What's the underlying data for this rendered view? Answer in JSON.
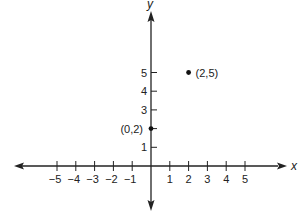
{
  "chart_data": {
    "type": "scatter",
    "title": "",
    "xlabel": "x",
    "ylabel": "y",
    "xlim": [
      -5,
      5
    ],
    "ylim": [
      0,
      5
    ],
    "x_ticks": [
      -5,
      -4,
      -3,
      -2,
      -1,
      1,
      2,
      3,
      4,
      5
    ],
    "y_ticks": [
      1,
      2,
      3,
      4,
      5
    ],
    "x_tick_labels": [
      "−5",
      "−4",
      "−3",
      "−2",
      "−1",
      "1",
      "2",
      "3",
      "4",
      "5"
    ],
    "y_tick_labels": [
      "1",
      "3",
      "4",
      "5"
    ],
    "y_labeled_ticks": [
      1,
      3,
      4,
      5
    ],
    "grid": false,
    "points": [
      {
        "x": 0,
        "y": 2,
        "label": "(0,2)",
        "label_side": "left"
      },
      {
        "x": 2,
        "y": 5,
        "label": "(2,5)",
        "label_side": "right"
      }
    ],
    "colors": {
      "axis": "#222222",
      "point": "#111111"
    }
  }
}
